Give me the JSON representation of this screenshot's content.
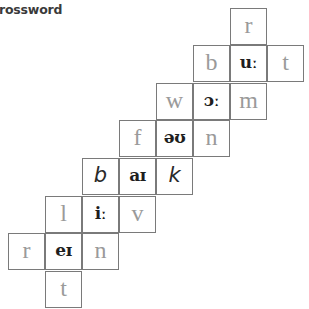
{
  "title": "rossword",
  "grid": {
    "cell_size": 37,
    "colors": {
      "border": "#7a7a7a",
      "given_text": "#9a9a9a",
      "vowel_text": "#1e1e1e",
      "answer_text": "#2a2a2a"
    },
    "cells": [
      {
        "row": 0,
        "col": 6,
        "text": "r",
        "type": "given"
      },
      {
        "row": 1,
        "col": 5,
        "text": "b",
        "type": "given"
      },
      {
        "row": 1,
        "col": 6,
        "text": "uː",
        "type": "vowel"
      },
      {
        "row": 1,
        "col": 7,
        "text": "t",
        "type": "given"
      },
      {
        "row": 2,
        "col": 4,
        "text": "w",
        "type": "given"
      },
      {
        "row": 2,
        "col": 5,
        "text": "ɔː",
        "type": "vowel"
      },
      {
        "row": 2,
        "col": 6,
        "text": "m",
        "type": "given"
      },
      {
        "row": 3,
        "col": 3,
        "text": "f",
        "type": "given"
      },
      {
        "row": 3,
        "col": 4,
        "text": "əʊ",
        "type": "vowel"
      },
      {
        "row": 3,
        "col": 5,
        "text": "n",
        "type": "given"
      },
      {
        "row": 4,
        "col": 2,
        "text": "b",
        "type": "answer"
      },
      {
        "row": 4,
        "col": 3,
        "text": "aɪ",
        "type": "vowel"
      },
      {
        "row": 4,
        "col": 4,
        "text": "k",
        "type": "answer"
      },
      {
        "row": 5,
        "col": 1,
        "text": "l",
        "type": "given"
      },
      {
        "row": 5,
        "col": 2,
        "text": "iː",
        "type": "vowel"
      },
      {
        "row": 5,
        "col": 3,
        "text": "v",
        "type": "given"
      },
      {
        "row": 6,
        "col": 0,
        "text": "r",
        "type": "given"
      },
      {
        "row": 6,
        "col": 1,
        "text": "eɪ",
        "type": "vowel"
      },
      {
        "row": 6,
        "col": 2,
        "text": "n",
        "type": "given"
      },
      {
        "row": 7,
        "col": 1,
        "text": "t",
        "type": "given"
      }
    ]
  }
}
